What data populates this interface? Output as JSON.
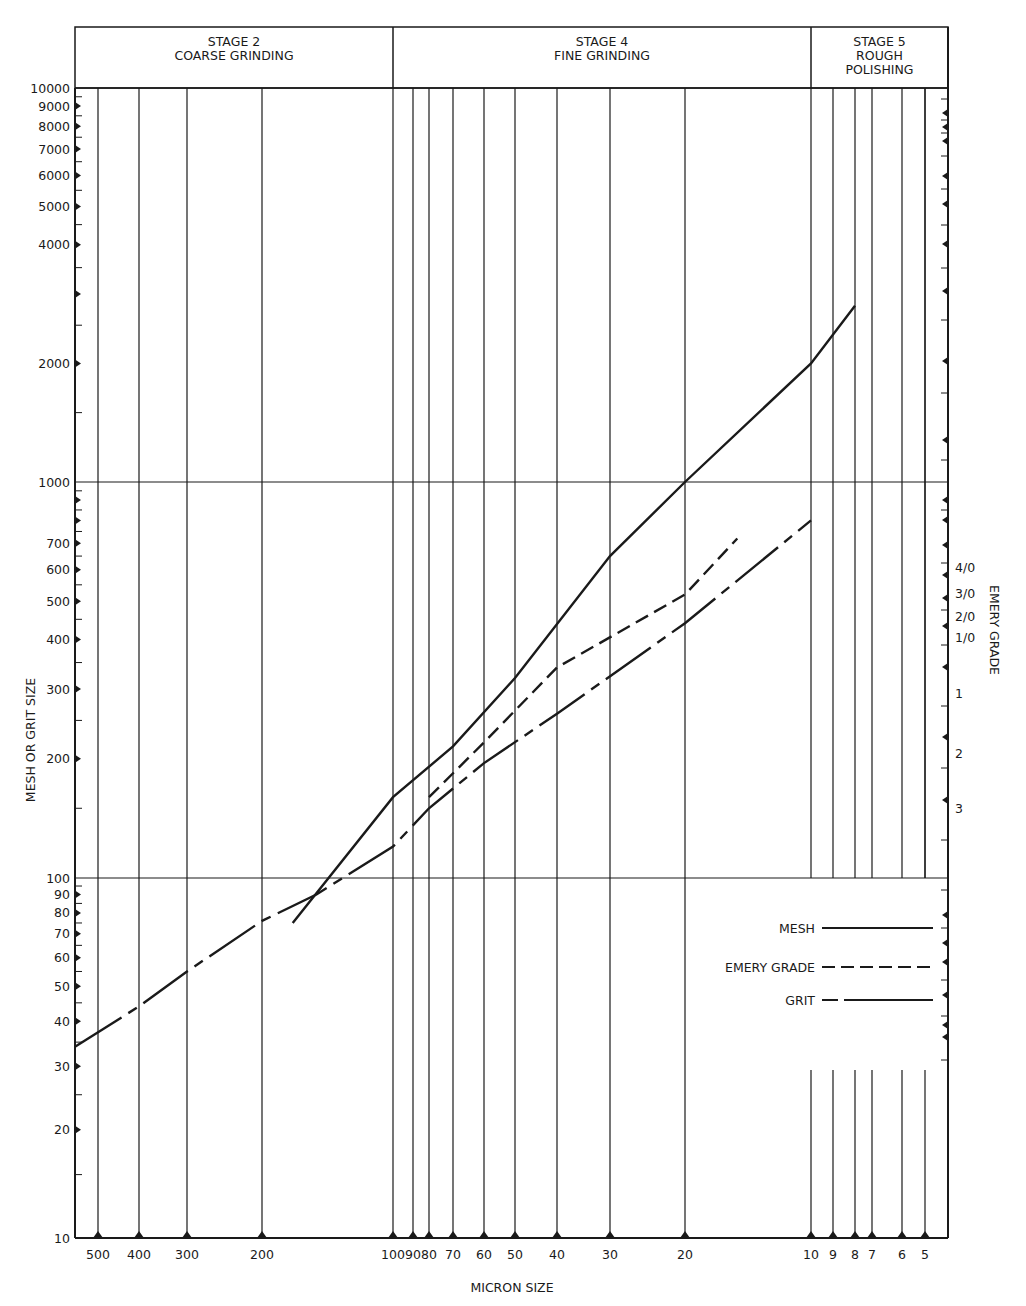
{
  "chart_data": {
    "type": "line",
    "title": "",
    "xlabel": "MICRON SIZE",
    "ylabel": "MESH OR GRIT SIZE",
    "right_axis_label": "EMERY GRADE",
    "x_scale": "log",
    "y_scale": "log",
    "x_reversed": true,
    "xlim": [
      550,
      4.5
    ],
    "ylim": [
      10,
      10000
    ],
    "grid": true,
    "stages": [
      {
        "line1": "STAGE 2",
        "line2": "COARSE GRINDING",
        "line3": "",
        "x_range_micron": [
          550,
          100
        ]
      },
      {
        "line1": "STAGE 4",
        "line2": "FINE GRINDING",
        "line3": "",
        "x_range_micron": [
          100,
          10
        ]
      },
      {
        "line1": "STAGE 5",
        "line2": "ROUGH",
        "line3": "POLISHING",
        "x_range_micron": [
          10,
          4.5
        ]
      }
    ],
    "x_ticks": [
      "500",
      "400",
      "300",
      "200",
      "100",
      "90",
      "80",
      "70",
      "60",
      "50",
      "40",
      "30",
      "20",
      "10",
      "9",
      "8",
      "7",
      "6",
      "5"
    ],
    "x_tick_values": [
      500,
      400,
      300,
      200,
      100,
      90,
      80,
      70,
      60,
      50,
      40,
      30,
      20,
      10,
      9,
      8,
      7,
      6,
      5
    ],
    "y_ticks": [
      "10000",
      "9000",
      "8000",
      "7000",
      "6000",
      "5000",
      "4000",
      "2000",
      "1000",
      "700",
      "600",
      "500",
      "400",
      "300",
      "200",
      "100",
      "90",
      "80",
      "70",
      "60",
      "50",
      "40",
      "30",
      "20",
      "10"
    ],
    "y_tick_values": [
      10000,
      9000,
      8000,
      7000,
      6000,
      5000,
      4000,
      2000,
      1000,
      700,
      600,
      500,
      400,
      300,
      200,
      100,
      90,
      80,
      70,
      60,
      50,
      40,
      30,
      20,
      10
    ],
    "right_ticks": [
      "4/0",
      "3/0",
      "2/0",
      "1/0",
      "1",
      "2",
      "3"
    ],
    "legend": {
      "position": "lower-right",
      "entries": [
        {
          "name": "MESH",
          "style": "solid"
        },
        {
          "name": "EMERY GRADE",
          "style": "dashed"
        },
        {
          "name": "GRIT",
          "style": "long-dash"
        }
      ]
    },
    "series": [
      {
        "name": "MESH",
        "style": "solid",
        "points": [
          [
            170,
            75
          ],
          [
            100,
            160
          ],
          [
            70,
            215
          ],
          [
            50,
            320
          ],
          [
            30,
            650
          ],
          [
            20,
            1000
          ],
          [
            10,
            2000
          ],
          [
            8,
            2800
          ]
        ]
      },
      {
        "name": "EMERY GRADE",
        "style": "dashed",
        "points": [
          [
            80,
            160
          ],
          [
            60,
            220
          ],
          [
            40,
            340
          ],
          [
            20,
            520
          ],
          [
            15,
            720
          ]
        ]
      },
      {
        "name": "GRIT",
        "style": "long-dash",
        "points": [
          [
            550,
            34
          ],
          [
            400,
            44
          ],
          [
            300,
            55
          ],
          [
            200,
            76
          ],
          [
            150,
            90
          ],
          [
            100,
            120
          ],
          [
            80,
            150
          ],
          [
            60,
            195
          ],
          [
            40,
            260
          ],
          [
            20,
            440
          ],
          [
            10,
            800
          ]
        ]
      }
    ]
  }
}
